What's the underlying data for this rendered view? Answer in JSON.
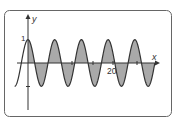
{
  "chart_data": {
    "type": "area",
    "title": "",
    "function": "y = cos x",
    "xlabel": "x",
    "ylabel": "y",
    "x_tick_labels": [
      {
        "value": 20,
        "label": "20"
      }
    ],
    "y_tick_labels": [
      {
        "value": 1,
        "label": "1"
      }
    ],
    "y_ticks": [
      1,
      -1
    ],
    "x_range_curve": [
      -3.14159,
      29.845
    ],
    "shaded_range": [
      0,
      29.845
    ],
    "ylim": [
      -1,
      1
    ],
    "grid": false,
    "legend": null,
    "colors": {
      "curve": "#333333",
      "fill": "#a9a9a9",
      "frame": "#555555"
    }
  },
  "labels": {
    "x_axis": "x",
    "y_axis": "y",
    "y_one": "1",
    "x_twenty": "20"
  }
}
